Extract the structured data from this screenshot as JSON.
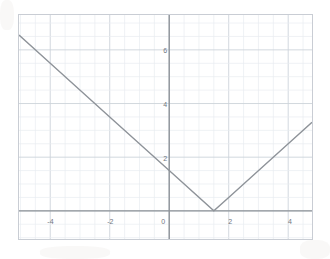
{
  "figure": {
    "kind": "coordinate-grid-graph",
    "background_color": "#ffffff",
    "frame_color": "#c9cdd4",
    "minor_grid_color": "#e8ecf1",
    "major_grid_color": "#cdd3da",
    "axis_color": "#8e9399",
    "curve_color": "#8e9399",
    "tick_text_color": "#6f7680"
  },
  "chart_data": {
    "type": "line",
    "title": "",
    "xlabel": "",
    "ylabel": "",
    "function": "y = |x - 1.5|",
    "vertex": {
      "x": 1.5,
      "y": 0
    },
    "y_intercept": 1.5,
    "slope_left": -1,
    "slope_right": 1,
    "xlim": [
      -5.05,
      4.8
    ],
    "ylim": [
      -1.05,
      7.3
    ],
    "grid": true,
    "minor_grid_step": 0.5,
    "major_grid_step": 2,
    "legend": "none",
    "x_ticks": [
      {
        "value": -4,
        "label": "-4"
      },
      {
        "value": -2,
        "label": "-2"
      },
      {
        "value": 0,
        "label": "0"
      },
      {
        "value": 2,
        "label": "2"
      },
      {
        "value": 4,
        "label": "4"
      }
    ],
    "y_ticks": [
      {
        "value": 2,
        "label": "2"
      },
      {
        "value": 4,
        "label": "4"
      },
      {
        "value": 6,
        "label": "6"
      }
    ],
    "series": [
      {
        "name": "y = |x - 1.5|",
        "points": [
          {
            "x": -5.05,
            "y": 6.55
          },
          {
            "x": -4,
            "y": 5.5
          },
          {
            "x": -2,
            "y": 3.5
          },
          {
            "x": 0,
            "y": 1.5
          },
          {
            "x": 1.5,
            "y": 0
          },
          {
            "x": 2,
            "y": 0.5
          },
          {
            "x": 4,
            "y": 2.5
          },
          {
            "x": 4.8,
            "y": 3.3
          }
        ]
      }
    ]
  }
}
